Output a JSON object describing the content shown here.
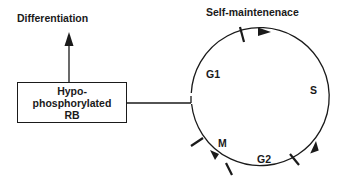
{
  "diagram": {
    "labels": {
      "differentiation": "Differentiation",
      "self_maintenance": "Self-maintenenace"
    },
    "box": {
      "line1": "Hypo-",
      "line2": "phosphorylated",
      "line3": "RB"
    },
    "cycle_phases": {
      "g1": "G1",
      "s": "S",
      "g2": "G2",
      "m": "M"
    },
    "colors": {
      "stroke": "#1a1a1a",
      "background": "#ffffff"
    }
  }
}
